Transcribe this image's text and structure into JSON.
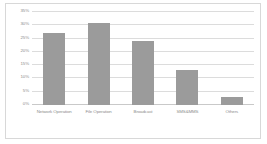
{
  "chart_data": {
    "type": "bar",
    "title": "",
    "xlabel": "",
    "ylabel": "",
    "ylim": [
      0,
      35
    ],
    "grid": true,
    "legend": false,
    "bar_color": "#9b9b9b",
    "categories": [
      "Network Operation",
      "File Operation",
      "Broadcast",
      "SMS&MMS",
      "Others"
    ],
    "values": [
      27,
      31,
      24,
      13,
      3
    ],
    "ytick_labels": [
      "35%",
      "30%",
      "25%",
      "20%",
      "15%",
      "10%",
      "5%",
      "0%"
    ],
    "ytick_values": [
      35,
      30,
      25,
      20,
      15,
      10,
      5,
      0
    ]
  }
}
